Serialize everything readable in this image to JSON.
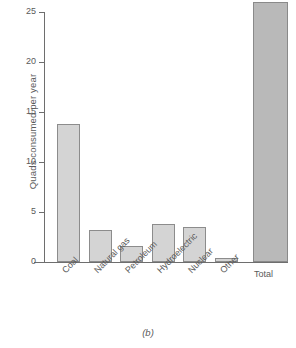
{
  "caption": "(b)",
  "chart_data": {
    "type": "bar",
    "title": "",
    "xlabel": "",
    "ylabel": "Quads consumed per year",
    "categories": [
      "Coal",
      "Natural gas",
      "Petroleum",
      "Hydroelectric",
      "Nuclear",
      "Other",
      "Total"
    ],
    "values": [
      13.8,
      3.2,
      1.6,
      3.8,
      3.5,
      0.4,
      26.0
    ],
    "ylim": [
      0,
      25
    ],
    "yticks": [
      0,
      5,
      10,
      15,
      20,
      25
    ],
    "ytick_labels": [
      "0",
      "5",
      "10",
      "15",
      "20",
      "25"
    ],
    "grid": false,
    "legend": "none",
    "series": [
      {
        "name": "Quads consumed per year",
        "values": [
          13.8,
          3.2,
          1.6,
          3.8,
          3.5,
          0.4,
          26.0
        ]
      }
    ],
    "bar_colors": {
      "default_fill": "#d4d4d4",
      "total_fill": "#b9b9b9",
      "edge": "#8c8c8c"
    },
    "label_rotation_deg": -45,
    "flat_labels": [
      "Total"
    ]
  },
  "axis": {
    "spine_color": "#6e6e6e"
  }
}
